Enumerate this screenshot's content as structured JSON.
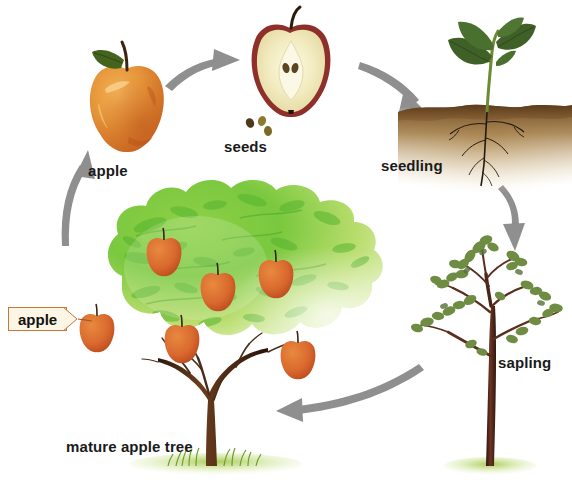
{
  "diagram": {
    "background_color": "#ffffff",
    "arrow_color": "#8f8f8f",
    "stages": [
      {
        "id": "apple",
        "label": "apple",
        "icon": "apple-fruit-icon",
        "order": 1,
        "colors": {
          "skin": "#e08a27",
          "highlight": "#f0ab4a",
          "leaf": "#4c6b1f",
          "stem": "#3b2410"
        }
      },
      {
        "id": "seeds",
        "label": "seeds",
        "icon": "apple-halved-with-seeds-icon",
        "order": 2,
        "colors": {
          "flesh": "#f2ecc2",
          "skin": "#8e2f2a",
          "seed": "#5d4420"
        }
      },
      {
        "id": "seedling",
        "label": "seedling",
        "icon": "seedling-in-soil-icon",
        "order": 3,
        "colors": {
          "leaf": "#45642a",
          "stem": "#6d8b32",
          "soil": "#6b4a24",
          "root": "#241a10"
        }
      },
      {
        "id": "sapling",
        "label": "sapling",
        "icon": "young-tree-icon",
        "order": 4,
        "colors": {
          "trunk": "#4a2418",
          "leaf": "#6f8c43",
          "grass": "#a8c44e"
        }
      },
      {
        "id": "mature-tree",
        "label": "mature apple tree",
        "icon": "mature-apple-tree-icon",
        "order": 5,
        "colors": {
          "canopy_dark": "#6bbf3a",
          "canopy_light": "#cfe48a",
          "trunk": "#4a2c18",
          "fruit": "#d9682f",
          "grass": "#9ec752"
        }
      }
    ],
    "callout": {
      "label": "apple",
      "border_color": "#c8763a",
      "fill_color": "#fdf6e4",
      "points_to": "canopy-apple-left"
    },
    "arrows": [
      {
        "id": "apple-to-seeds",
        "from": "apple",
        "to": "seeds"
      },
      {
        "id": "seeds-to-seedling",
        "from": "seeds",
        "to": "seedling"
      },
      {
        "id": "seedling-to-sapling",
        "from": "seedling",
        "to": "sapling"
      },
      {
        "id": "sapling-to-mature-tree",
        "from": "sapling",
        "to": "mature-tree"
      },
      {
        "id": "mature-tree-to-apple",
        "from": "mature-tree",
        "to": "apple"
      }
    ],
    "canopy_fruit_count": 6
  }
}
